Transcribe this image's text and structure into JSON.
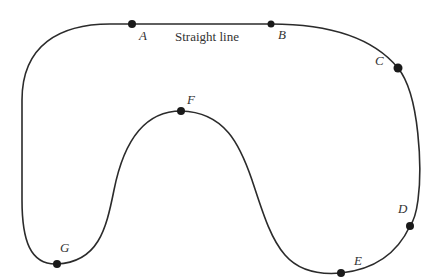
{
  "diagram": {
    "stroke_color": "#2b2b2b",
    "point_color": "#1a1a1a",
    "segment_caption": "Straight line",
    "points": [
      {
        "id": "A",
        "label": "A"
      },
      {
        "id": "B",
        "label": "B"
      },
      {
        "id": "C",
        "label": "C"
      },
      {
        "id": "D",
        "label": "D"
      },
      {
        "id": "E",
        "label": "E"
      },
      {
        "id": "F",
        "label": "F"
      },
      {
        "id": "G",
        "label": "G"
      }
    ]
  }
}
